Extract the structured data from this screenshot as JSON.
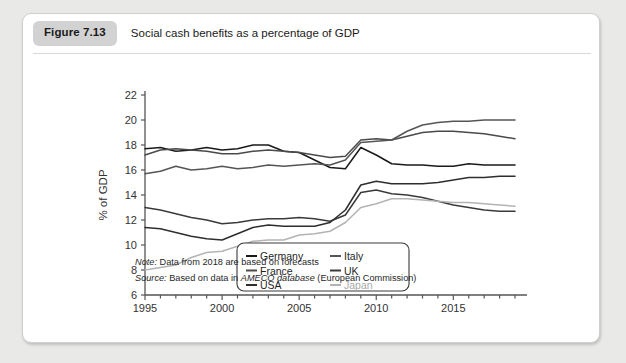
{
  "figure": {
    "badge": "Figure 7.13",
    "caption": "Social cash benefits as a percentage of GDP"
  },
  "notes": {
    "note_label": "Note:",
    "note_text": " Data from 2018 are based on forecasts",
    "source_label": "Source:",
    "source_pre": " Based on data in ",
    "source_italic": "AMECO database",
    "source_post": " (European Commission)"
  },
  "colors": {
    "germany": "#1a1a1a",
    "france": "#4a4a4a",
    "usa": "#2e2e2e",
    "italy": "#555555",
    "uk": "#3a3a3a",
    "japan": "#b3b3b3",
    "axis": "#555555",
    "card_bg": "#ffffff",
    "badge_bg": "#d2d2d2",
    "page_bg": "#e9e9e7"
  },
  "chart_data": {
    "type": "line",
    "title": "Social cash benefits as a percentage of GDP",
    "xlabel": "",
    "ylabel": "% of GDP",
    "ylim": [
      6,
      22
    ],
    "xlim": [
      1995,
      2019
    ],
    "ytick_labels": [
      "6",
      "8",
      "10",
      "12",
      "14",
      "16",
      "18",
      "20",
      "22"
    ],
    "yticks": [
      6,
      8,
      10,
      12,
      14,
      16,
      18,
      20,
      22
    ],
    "xtick_labels": [
      "1995",
      "2000",
      "2005",
      "2010",
      "2015"
    ],
    "xticks": [
      1995,
      2000,
      2005,
      2010,
      2015
    ],
    "minor_xticks_every": 1,
    "grid": false,
    "legend_position": "inside lower-right",
    "x": [
      1995,
      1996,
      1997,
      1998,
      1999,
      2000,
      2001,
      2002,
      2003,
      2004,
      2005,
      2006,
      2007,
      2008,
      2009,
      2010,
      2011,
      2012,
      2013,
      2014,
      2015,
      2016,
      2017,
      2018,
      2019
    ],
    "series": [
      {
        "name": "Germany",
        "color": "#1a1a1a",
        "values": [
          17.7,
          17.8,
          17.5,
          17.6,
          17.8,
          17.6,
          17.7,
          18.0,
          18.0,
          17.5,
          17.4,
          16.8,
          16.2,
          16.1,
          17.8,
          17.2,
          16.5,
          16.4,
          16.4,
          16.3,
          16.3,
          16.5,
          16.4,
          16.4,
          16.4
        ]
      },
      {
        "name": "France",
        "color": "#4a4a4a",
        "values": [
          17.2,
          17.6,
          17.7,
          17.6,
          17.5,
          17.3,
          17.3,
          17.5,
          17.6,
          17.5,
          17.4,
          17.2,
          17.0,
          17.1,
          18.4,
          18.5,
          18.4,
          18.7,
          19.0,
          19.1,
          19.1,
          19.0,
          18.9,
          18.7,
          18.5
        ]
      },
      {
        "name": "Italy",
        "color": "#555555",
        "values": [
          15.7,
          15.9,
          16.3,
          16.0,
          16.1,
          16.3,
          16.1,
          16.2,
          16.4,
          16.3,
          16.4,
          16.5,
          16.4,
          16.8,
          18.2,
          18.3,
          18.4,
          19.1,
          19.6,
          19.8,
          19.9,
          19.9,
          20.0,
          20.0,
          20.0
        ]
      },
      {
        "name": "UK",
        "color": "#3a3a3a",
        "values": [
          13.0,
          12.8,
          12.5,
          12.2,
          12.0,
          11.7,
          11.8,
          12.0,
          12.1,
          12.1,
          12.2,
          12.1,
          11.9,
          12.4,
          14.2,
          14.4,
          14.1,
          14.0,
          13.8,
          13.5,
          13.2,
          13.0,
          12.8,
          12.7,
          12.7
        ]
      },
      {
        "name": "USA",
        "color": "#2e2e2e",
        "values": [
          11.4,
          11.3,
          11.0,
          10.7,
          10.5,
          10.4,
          10.9,
          11.4,
          11.6,
          11.5,
          11.5,
          11.5,
          11.8,
          12.8,
          14.8,
          15.1,
          14.9,
          14.9,
          14.9,
          15.0,
          15.2,
          15.4,
          15.4,
          15.5,
          15.5
        ]
      },
      {
        "name": "Japan",
        "color": "#b3b3b3",
        "values": [
          8.0,
          8.2,
          8.4,
          9.0,
          9.4,
          9.5,
          9.9,
          10.3,
          10.4,
          10.4,
          10.8,
          10.9,
          11.1,
          11.8,
          13.0,
          13.3,
          13.7,
          13.7,
          13.6,
          13.5,
          13.4,
          13.4,
          13.3,
          13.2,
          13.1
        ]
      }
    ],
    "legend": [
      {
        "label": "Germany",
        "color": "#1a1a1a"
      },
      {
        "label": "Italy",
        "color": "#555555"
      },
      {
        "label": "France",
        "color": "#4a4a4a"
      },
      {
        "label": "UK",
        "color": "#3a3a3a"
      },
      {
        "label": "USA",
        "color": "#2e2e2e"
      },
      {
        "label": "Japan",
        "color": "#b3b3b3"
      }
    ]
  }
}
